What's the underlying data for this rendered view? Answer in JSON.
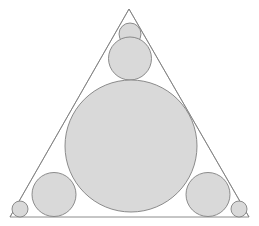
{
  "figure": {
    "background_color": "#ffffff",
    "canvas": {
      "width": 259,
      "height": 226
    },
    "stroke_color": "#808080",
    "fill_color": "#d9d9d9",
    "stroke_width": 1,
    "triangle": {
      "name": "outer-triangle",
      "points": "129,9 10,217 249,217",
      "vertices": [
        {
          "label": "apex",
          "x": 129,
          "y": 9
        },
        {
          "label": "bottom-left",
          "x": 10,
          "y": 217
        },
        {
          "label": "bottom-right",
          "x": 249,
          "y": 217
        }
      ],
      "stroke": "#808080",
      "fill": "none",
      "stroke_width": 0.9
    },
    "circles": [
      {
        "name": "apex-small-circle",
        "cx": 130,
        "cy": 34,
        "r": 11,
        "fill": "#d9d9d9",
        "stroke": "#808080"
      },
      {
        "name": "top-medium-circle",
        "cx": 130,
        "cy": 58.5,
        "r": 21.5,
        "fill": "#d9d9d9",
        "stroke": "#808080"
      },
      {
        "name": "central-large-circle",
        "cx": 131,
        "cy": 146,
        "r": 66,
        "fill": "#d9d9d9",
        "stroke": "#808080"
      },
      {
        "name": "bottom-left-medium-circle",
        "cx": 54,
        "cy": 194.5,
        "r": 22,
        "fill": "#d9d9d9",
        "stroke": "#808080"
      },
      {
        "name": "bottom-right-medium-circle",
        "cx": 208,
        "cy": 194.5,
        "r": 22,
        "fill": "#d9d9d9",
        "stroke": "#808080"
      },
      {
        "name": "bottom-left-corner-circle",
        "cx": 20,
        "cy": 209,
        "r": 8,
        "fill": "#d9d9d9",
        "stroke": "#808080"
      },
      {
        "name": "bottom-right-corner-circle",
        "cx": 239,
        "cy": 209,
        "r": 8,
        "fill": "#d9d9d9",
        "stroke": "#808080"
      }
    ],
    "inner_tangent_lines": [
      {
        "name": "left-inner-cevian",
        "x1": 129,
        "y1": 9,
        "x2": 10,
        "y2": 217,
        "stroke": "#808080"
      },
      {
        "name": "right-inner-cevian",
        "x1": 129,
        "y1": 9,
        "x2": 249,
        "y2": 217,
        "stroke": "#808080"
      }
    ]
  }
}
